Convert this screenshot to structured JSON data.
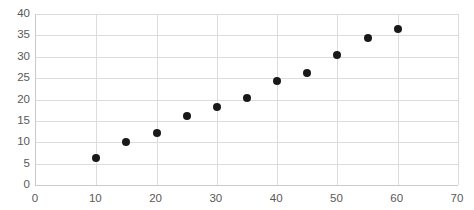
{
  "chart_data": {
    "type": "scatter",
    "title": "",
    "xlabel": "",
    "ylabel": "",
    "xlim": [
      0,
      70
    ],
    "ylim": [
      0,
      40
    ],
    "xticks": [
      0,
      10,
      20,
      30,
      40,
      50,
      60,
      70
    ],
    "yticks": [
      0,
      5,
      10,
      15,
      20,
      25,
      30,
      35,
      40
    ],
    "xtick_labels": [
      "0",
      "10",
      "20",
      "30",
      "40",
      "50",
      "60",
      "70"
    ],
    "ytick_labels": [
      "0",
      "5",
      "10",
      "15",
      "20",
      "25",
      "30",
      "35",
      "40"
    ],
    "grid": true,
    "grid_axes": "both",
    "legend": false,
    "legend_position": "none",
    "marker": "circle",
    "marker_color": "#191919",
    "marker_size_px": 8,
    "gridline_color": "#dadcde",
    "axis_color": "#c9cbcd",
    "tick_label_color": "#595959",
    "background_color": "#ffffff",
    "series": [
      {
        "name": "series-1",
        "x": [
          10,
          15,
          20,
          25,
          30,
          35,
          40,
          45,
          50,
          55,
          60
        ],
        "y": [
          6.2,
          10.1,
          12.1,
          16.2,
          18.2,
          20.3,
          24.4,
          26.3,
          30.4,
          34.5,
          36.5
        ],
        "points": [
          {
            "x": 10,
            "y": 6.2
          },
          {
            "x": 15,
            "y": 10.1
          },
          {
            "x": 20,
            "y": 12.1
          },
          {
            "x": 25,
            "y": 16.2
          },
          {
            "x": 30,
            "y": 18.2
          },
          {
            "x": 35,
            "y": 20.3
          },
          {
            "x": 40,
            "y": 24.4
          },
          {
            "x": 45,
            "y": 26.3
          },
          {
            "x": 50,
            "y": 30.4
          },
          {
            "x": 55,
            "y": 34.5
          },
          {
            "x": 60,
            "y": 36.5
          }
        ]
      }
    ]
  }
}
